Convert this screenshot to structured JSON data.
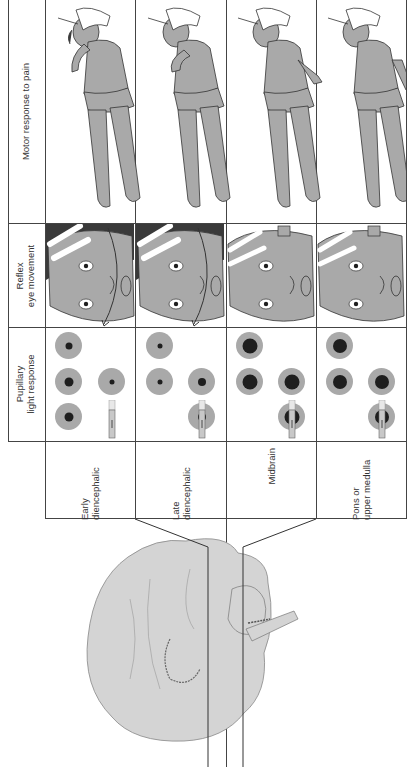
{
  "figure": {
    "orientation": "rotated-90-ccw",
    "headers": [
      {
        "key": "motor",
        "label": "Motor response to pain"
      },
      {
        "key": "eye",
        "label_line1": "Reflex",
        "label_line2": "eye movement"
      },
      {
        "key": "pupil",
        "label_line1": "Pupillary",
        "label_line2": "light response"
      }
    ],
    "rows": [
      {
        "level_line1": "Early",
        "level_line2": "diencephalic",
        "motor": "decorticate-flexion-partial",
        "eye": "full-doll's-eye-movement",
        "pupils": "small-reactive"
      },
      {
        "level_line1": "Late",
        "level_line2": "diencephalic",
        "motor": "decorticate-flexion",
        "eye": "full-doll's-eye-movement",
        "pupils": "small-reactive"
      },
      {
        "level_line1": "Midbrain",
        "level_line2": "",
        "motor": "decerebrate-extension",
        "eye": "impaired-caloric-response",
        "pupils": "midposition-fixed"
      },
      {
        "level_line1": "Pons or",
        "level_line2": "upper medulla",
        "motor": "flaccid-flexion-legs",
        "eye": "no-caloric-response",
        "pupils": "midposition-fixed"
      }
    ],
    "colors": {
      "grid_line": "#444444",
      "skin_fill": "#a9a9a9",
      "brain_fill": "#d4d4d4",
      "pupil_iris": "#a9a9a9",
      "pupil_core": "#1e1e1e",
      "hair": "#3a3a3a"
    }
  }
}
